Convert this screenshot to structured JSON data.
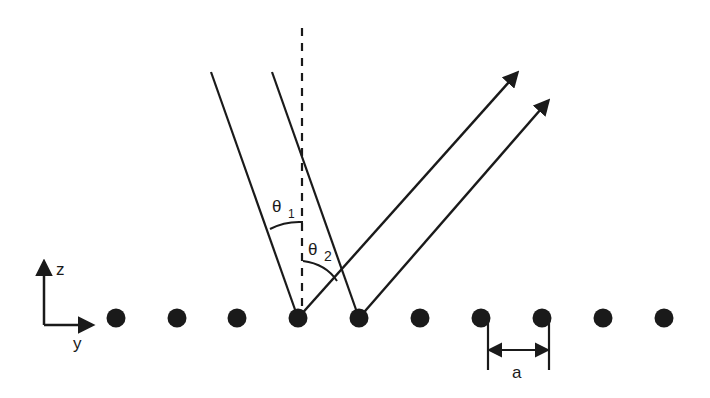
{
  "diagram": {
    "type": "scattering-geometry",
    "labels": {
      "axis_z": "z",
      "axis_y": "y",
      "theta1_symbol": "θ",
      "theta1_sub": "1",
      "theta2_symbol": "θ",
      "theta2_sub": "2",
      "spacing": "a"
    },
    "atoms_x": [
      116,
      177,
      237,
      298,
      359,
      420,
      481,
      542,
      603,
      664
    ],
    "atoms_y": 318,
    "colors": {
      "ink": "#1a1a1a",
      "background": "#ffffff"
    }
  }
}
